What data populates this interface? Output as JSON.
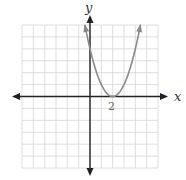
{
  "chart_data": {
    "type": "line",
    "title": "",
    "xlabel": "x",
    "ylabel": "y",
    "function": "y = (x - 2)^2",
    "xlim": [
      -6,
      6
    ],
    "ylim": [
      -6,
      6
    ],
    "grid": true,
    "grid_step": 1,
    "tick_labels": [
      {
        "value": 2,
        "axis": "x",
        "label": "2"
      }
    ],
    "annotations": [
      "vertex at (2, 0)"
    ],
    "series": [
      {
        "name": "parabola",
        "color": "#8a8a8a",
        "x": [
          -0.45,
          0,
          0.5,
          1,
          1.5,
          2,
          2.5,
          3,
          3.5,
          4,
          4.45
        ],
        "y": [
          6,
          4,
          2.25,
          1,
          0.25,
          0,
          0.25,
          1,
          2.25,
          4,
          6
        ]
      }
    ],
    "legend": null
  },
  "axes": {
    "x_label": "x",
    "y_label": "y",
    "x_tick": "2"
  },
  "colors": {
    "grid": "#d6d6d6",
    "axis": "#222222",
    "curve": "#8a8a8a",
    "tick_text": "#666666"
  }
}
